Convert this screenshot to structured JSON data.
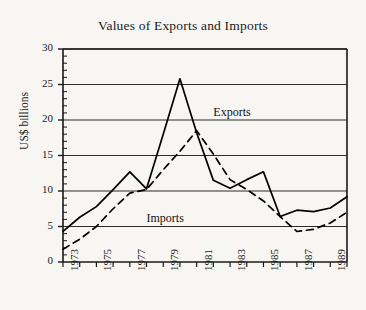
{
  "chart_data": {
    "type": "line",
    "title": "Values of Exports and Imports",
    "xlabel": "",
    "ylabel": "US$ billions",
    "xlim": [
      1973,
      1990
    ],
    "ylim": [
      0,
      30
    ],
    "yticks": [
      0,
      5,
      10,
      15,
      20,
      25,
      30
    ],
    "ytick_labels": [
      "0",
      "5",
      "10",
      "15",
      "20",
      "25",
      "30"
    ],
    "y_minor_tick_step": 1,
    "xticks": [
      1973,
      1974,
      1975,
      1976,
      1977,
      1978,
      1979,
      1980,
      1981,
      1982,
      1983,
      1984,
      1985,
      1986,
      1987,
      1988,
      1989,
      1990
    ],
    "xtick_labels_shown": [
      "1973",
      "1975",
      "1977",
      "1979",
      "1981",
      "1983",
      "1985",
      "1987",
      "1989"
    ],
    "grid": "horizontal",
    "legend_position": "inline-annotations",
    "x": [
      1973,
      1974,
      1975,
      1976,
      1977,
      1978,
      1979,
      1980,
      1981,
      1982,
      1983,
      1984,
      1985,
      1986,
      1987,
      1988,
      1989,
      1990
    ],
    "series": [
      {
        "name": "Exports",
        "style": "solid",
        "color": "#000000",
        "values": [
          4.3,
          6.3,
          7.8,
          10.2,
          12.7,
          10.3,
          18.0,
          25.8,
          18.2,
          11.5,
          10.4,
          11.6,
          12.7,
          6.4,
          7.3,
          7.1,
          7.6,
          9.2
        ]
      },
      {
        "name": "Imports",
        "style": "dashed",
        "color": "#000000",
        "values": [
          1.8,
          3.2,
          5.0,
          7.5,
          9.7,
          10.2,
          13.0,
          15.6,
          18.5,
          15.2,
          11.6,
          10.2,
          8.6,
          6.4,
          4.3,
          4.6,
          5.5,
          7.0
        ]
      }
    ],
    "annotations": [
      {
        "text": "Exports",
        "x": 1982.0,
        "y": 21.0
      },
      {
        "text": "Imports",
        "x": 1978.0,
        "y": 6.1
      }
    ]
  }
}
